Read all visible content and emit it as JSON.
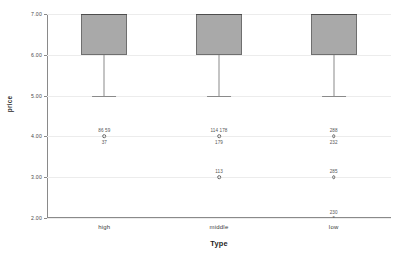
{
  "chart_data": {
    "type": "box",
    "title": "",
    "xlabel": "Type",
    "ylabel": "price",
    "categories": [
      "high",
      "middle",
      "low"
    ],
    "ylim": [
      2.0,
      7.0
    ],
    "yticks": [
      7.0,
      6.0,
      5.0,
      4.0,
      3.0,
      2.0
    ],
    "ytick_labels": [
      "7.00",
      "6.00",
      "5.00",
      "4.00",
      "3.00",
      "2.00"
    ],
    "grid": true,
    "legend": "none",
    "boxes": [
      {
        "category": "high",
        "whisker_low": 5.0,
        "q1": 6.0,
        "median": 7.0,
        "q3": 7.0,
        "whisker_high": 7.0,
        "outliers": [
          {
            "value": 4.0,
            "marker": "circle",
            "labels_above": "86  59",
            "label_below": "37"
          }
        ]
      },
      {
        "category": "middle",
        "whisker_low": 5.0,
        "q1": 6.0,
        "median": 7.0,
        "q3": 7.0,
        "whisker_high": 7.0,
        "outliers": [
          {
            "value": 4.0,
            "marker": "circle",
            "labels_above": "114  178",
            "label_below": "179"
          },
          {
            "value": 3.0,
            "marker": "circle",
            "labels_above": "113",
            "label_below": ""
          }
        ]
      },
      {
        "category": "low",
        "whisker_low": 5.0,
        "q1": 6.0,
        "median": 7.0,
        "q3": 7.0,
        "whisker_high": 7.0,
        "outliers": [
          {
            "value": 4.0,
            "marker": "circle",
            "labels_above": "288",
            "label_below": "232"
          },
          {
            "value": 3.0,
            "marker": "circle",
            "labels_above": "285",
            "label_below": ""
          },
          {
            "value": 2.0,
            "marker": "star",
            "labels_above": "230",
            "label_below": ""
          }
        ]
      }
    ],
    "colors": {
      "box_fill": "#a9a9a9",
      "box_border": "#6f6f6f",
      "gridline": "#ececec",
      "axis": "#8a8a8a",
      "text": "#3a3a3a"
    }
  }
}
